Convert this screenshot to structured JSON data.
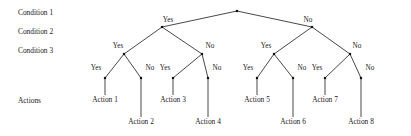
{
  "diagram": {
    "type": "decision-tree",
    "title": "",
    "row_labels": [
      {
        "text": "Condition 1",
        "x": 18,
        "y": 9
      },
      {
        "text": "Condition 2",
        "x": 18,
        "y": 28
      },
      {
        "text": "Condition 3",
        "x": 18,
        "y": 47
      },
      {
        "text": "Actions",
        "x": 18,
        "y": 97
      }
    ],
    "nodes": [
      {
        "id": "root",
        "x": 237,
        "y": 11
      },
      {
        "id": "n2a",
        "x": 162,
        "y": 27
      },
      {
        "id": "n2b",
        "x": 312,
        "y": 27
      },
      {
        "id": "n3a",
        "x": 124,
        "y": 54
      },
      {
        "id": "n3b",
        "x": 202,
        "y": 54
      },
      {
        "id": "n3c",
        "x": 274,
        "y": 54
      },
      {
        "id": "n3d",
        "x": 350,
        "y": 54
      },
      {
        "id": "l1",
        "x": 105,
        "y": 78
      },
      {
        "id": "l2",
        "x": 141,
        "y": 78
      },
      {
        "id": "l3",
        "x": 173,
        "y": 78
      },
      {
        "id": "l4",
        "x": 208,
        "y": 78
      },
      {
        "id": "l5",
        "x": 257,
        "y": 78
      },
      {
        "id": "l6",
        "x": 293,
        "y": 78
      },
      {
        "id": "l7",
        "x": 325,
        "y": 78
      },
      {
        "id": "l8",
        "x": 361,
        "y": 78
      }
    ],
    "edges": [
      {
        "from": "root",
        "to": "n2a"
      },
      {
        "from": "root",
        "to": "n2b"
      },
      {
        "from": "n2a",
        "to": "n3a"
      },
      {
        "from": "n2a",
        "to": "n3b"
      },
      {
        "from": "n2b",
        "to": "n3c"
      },
      {
        "from": "n2b",
        "to": "n3d"
      },
      {
        "from": "n3a",
        "to": "l1"
      },
      {
        "from": "n3a",
        "to": "l2"
      },
      {
        "from": "n3b",
        "to": "l3"
      },
      {
        "from": "n3b",
        "to": "l4"
      },
      {
        "from": "n3c",
        "to": "l5"
      },
      {
        "from": "n3c",
        "to": "l6"
      },
      {
        "from": "n3d",
        "to": "l7"
      },
      {
        "from": "n3d",
        "to": "l8"
      }
    ],
    "stems": [
      {
        "node": "l1",
        "x": 105,
        "y1": 78,
        "y2": 95
      },
      {
        "node": "l2",
        "x": 141,
        "y1": 78,
        "y2": 117
      },
      {
        "node": "l3",
        "x": 173,
        "y1": 78,
        "y2": 95
      },
      {
        "node": "l4",
        "x": 208,
        "y1": 78,
        "y2": 117
      },
      {
        "node": "l5",
        "x": 257,
        "y1": 78,
        "y2": 95
      },
      {
        "node": "l6",
        "x": 293,
        "y1": 78,
        "y2": 117
      },
      {
        "node": "l7",
        "x": 325,
        "y1": 78,
        "y2": 95
      },
      {
        "node": "l8",
        "x": 361,
        "y1": 78,
        "y2": 117
      }
    ],
    "edge_labels": [
      {
        "text": "Yes",
        "x": 168,
        "y": 17
      },
      {
        "text": "No",
        "x": 308,
        "y": 17
      },
      {
        "text": "Yes",
        "x": 118,
        "y": 43
      },
      {
        "text": "No",
        "x": 210,
        "y": 43
      },
      {
        "text": "Yes",
        "x": 266,
        "y": 43
      },
      {
        "text": "No",
        "x": 357,
        "y": 43
      },
      {
        "text": "Yes",
        "x": 96,
        "y": 65
      },
      {
        "text": "No",
        "x": 150,
        "y": 65
      },
      {
        "text": "Yes",
        "x": 165,
        "y": 65
      },
      {
        "text": "No",
        "x": 217,
        "y": 65
      },
      {
        "text": "Yes",
        "x": 248,
        "y": 65
      },
      {
        "text": "No",
        "x": 302,
        "y": 65
      },
      {
        "text": "Yes",
        "x": 317,
        "y": 65
      },
      {
        "text": "No",
        "x": 370,
        "y": 65
      }
    ],
    "action_labels": [
      {
        "text": "Action 1",
        "x": 105,
        "y": 96
      },
      {
        "text": "Action 2",
        "x": 141,
        "y": 118
      },
      {
        "text": "Action 3",
        "x": 173,
        "y": 96
      },
      {
        "text": "Action 4",
        "x": 208,
        "y": 118
      },
      {
        "text": "Action 5",
        "x": 257,
        "y": 96
      },
      {
        "text": "Action 6",
        "x": 293,
        "y": 118
      },
      {
        "text": "Action 7",
        "x": 325,
        "y": 96
      },
      {
        "text": "Action 8",
        "x": 361,
        "y": 118
      }
    ],
    "style": {
      "line_color": "#1a1a1a",
      "node_color": "#111111",
      "background": "#ffffff"
    }
  }
}
